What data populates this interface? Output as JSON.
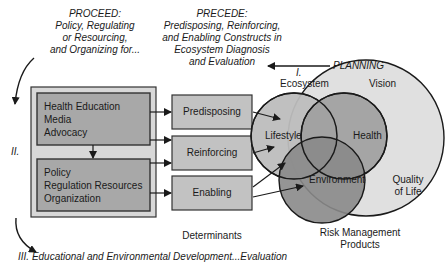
{
  "proceed": {
    "heading": "PROCEED:",
    "lines": [
      "Policy, Regulating",
      "or Resourcing,",
      "and Organizing for..."
    ]
  },
  "precede": {
    "heading": "PRECEDE:",
    "lines": [
      "Predisposing, Reinforcing,",
      "and Enabling Constructs in",
      "Ecosystem Diagnosis",
      "and Evaluation"
    ]
  },
  "planning_label": "PLANNING",
  "phase_labels": {
    "phase1": "I.",
    "phase2": "II.",
    "phase3": "III. Educational and Environmental Development...Evaluation"
  },
  "interventions": {
    "upper_box": [
      "Health Education",
      "Media",
      "Advocacy"
    ],
    "lower_box": [
      "Policy",
      "Regulation Resources",
      "Organization"
    ]
  },
  "determinants": {
    "items": [
      "Predisposing",
      "Reinforcing",
      "Enabling"
    ],
    "caption": "Determinants"
  },
  "venn": {
    "ecosystem_label": "Ecosystem",
    "vision_label": "Vision",
    "circles": [
      "Lifestyle",
      "Health",
      "Environment"
    ],
    "outer_label_line1": "Quality",
    "outer_label_line2": "of Life",
    "caption_line1": "Risk Management",
    "caption_line2": "Products"
  },
  "colors": {
    "outer_box": "#d8d8d8",
    "inner_box": "#a8a8a8",
    "det_box": "#c2c2c2",
    "lifestyle": "#bdbdbd",
    "health": "#9e9e9e",
    "environment": "#8a8a8a",
    "quality": "#e0e0e0"
  }
}
